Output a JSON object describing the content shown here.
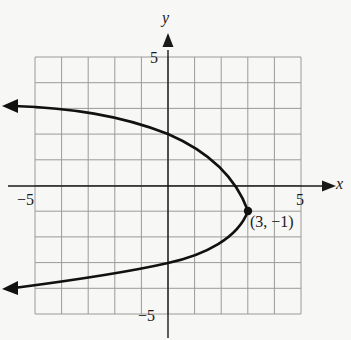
{
  "chart_data": {
    "type": "line",
    "title": "",
    "xlabel": "x",
    "ylabel": "y",
    "xlim": [
      -5,
      5
    ],
    "ylim": [
      -5,
      5
    ],
    "grid": true,
    "grid_step": 1,
    "tick_labels": {
      "x": [
        "-5",
        "5"
      ],
      "y": [
        "5",
        "-5"
      ]
    },
    "series": [
      {
        "name": "parabola",
        "points": [
          {
            "x": -6.0,
            "y": 3.1
          },
          {
            "x": -5.0,
            "y": 3.05
          },
          {
            "x": -2.5,
            "y": 3.35
          },
          {
            "x": 0.0,
            "y": 2.0
          },
          {
            "x": 2.0,
            "y": 0.5
          },
          {
            "x": 3.0,
            "y": -1.0
          },
          {
            "x": 2.0,
            "y": -2.2
          },
          {
            "x": 0.0,
            "y": -3.0
          },
          {
            "x": -2.5,
            "y": -3.6
          },
          {
            "x": -5.0,
            "y": -3.9
          },
          {
            "x": -6.0,
            "y": -4.0
          }
        ]
      }
    ],
    "annotations": [
      {
        "label": "(3, −1)",
        "x": 3,
        "y": -1,
        "marker": "filled-circle"
      }
    ]
  },
  "labels": {
    "x_axis": "x",
    "y_axis": "y",
    "x_min": "−5",
    "x_max": "5",
    "y_max": "5",
    "y_min": "−5",
    "vertex": "(3, −1)"
  }
}
